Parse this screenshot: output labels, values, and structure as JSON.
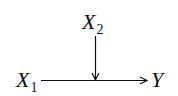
{
  "diagram": {
    "type": "causal-graph",
    "nodes": {
      "x2": {
        "base": "X",
        "subscript": "2"
      },
      "x1": {
        "base": "X",
        "subscript": "1"
      },
      "y": {
        "base": "Y",
        "subscript": ""
      }
    },
    "edges": [
      {
        "from": "X1",
        "to": "Y",
        "direction": "horizontal"
      },
      {
        "from": "X2",
        "to": "X1→Y edge",
        "direction": "vertical"
      }
    ],
    "colors": {
      "stroke": "#111111",
      "background": "#ffffff"
    }
  }
}
